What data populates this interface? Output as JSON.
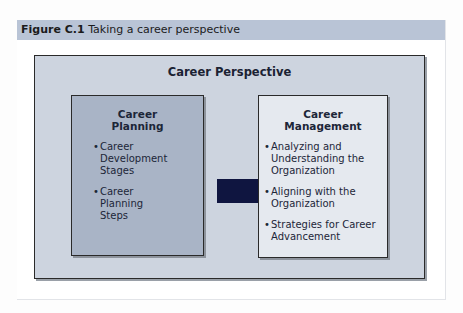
{
  "figure": {
    "number": "Figure C.1",
    "caption": "Taking a career perspective"
  },
  "diagram": {
    "title": "Career Perspective",
    "left_box": {
      "title_line1": "Career",
      "title_line2": "Planning",
      "items": [
        "Career Development Stages",
        "Career Planning Steps"
      ]
    },
    "right_box": {
      "title_line1": "Career",
      "title_line2": "Management",
      "items": [
        "Analyzing and Understanding the Organization",
        "Aligning with the Organization",
        "Strategies for Career Advancement"
      ]
    },
    "arrow": {
      "from": "Career Planning",
      "to": "Career Management",
      "color": "#0f1540"
    },
    "bullet_glyph": "•"
  },
  "colors": {
    "header_bg": "#b9c4d6",
    "outer_bg": "#cdd4df",
    "left_box_bg": "#a9b4c6",
    "right_box_bg": "#e5e9ef",
    "arrow": "#0f1540"
  }
}
